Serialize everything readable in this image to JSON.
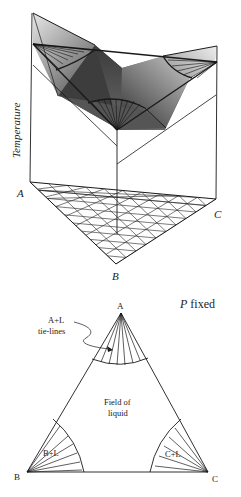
{
  "upper_diagram": {
    "axis_label": "Temperature",
    "corner_labels": {
      "left": "A",
      "right": "C",
      "bottom": "B"
    }
  },
  "lower_diagram": {
    "condition": {
      "italic": "P",
      "rest": "fixed"
    },
    "vertices": {
      "top": "A",
      "left": "B",
      "right": "C"
    },
    "annotation": {
      "line1": "A+L",
      "line2": "tie-lines"
    },
    "field": {
      "line1": "Field of",
      "line2": "liquid"
    },
    "regions": {
      "b": "B+L",
      "c": "C+L"
    }
  },
  "colors": {
    "line": "#1a1a1a",
    "shade_dark": "#2b2b2b",
    "shade_light": "#cfcfcf"
  }
}
